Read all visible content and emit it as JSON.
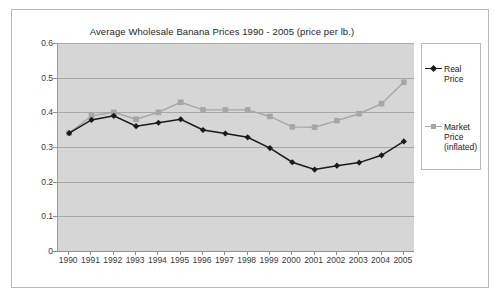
{
  "chart_data": {
    "type": "line",
    "title": "Average Wholesale Banana Prices 1990 - 2005  (price per lb.)",
    "xlabel": "",
    "ylabel": "",
    "categories": [
      "1990",
      "1991",
      "1992",
      "1993",
      "1994",
      "1995",
      "1996",
      "1997",
      "1998",
      "1999",
      "2000",
      "2001",
      "2002",
      "2003",
      "2004",
      "2005"
    ],
    "ylim": [
      0,
      0.6
    ],
    "ytick_labels": [
      "0.6",
      "0.5",
      "0.4",
      "0.3",
      "0.2",
      "0.1",
      "0"
    ],
    "ytick_values": [
      0.6,
      0.5,
      0.4,
      0.3,
      0.2,
      0.1,
      0
    ],
    "grid": true,
    "legend_position": "right",
    "plot_background": "#d6d6d6",
    "series": [
      {
        "name": "Real Price",
        "legend_label_lines": [
          "Real",
          "Price"
        ],
        "color": "#1a1a1a",
        "marker": "diamond",
        "values": [
          0.34,
          0.378,
          0.39,
          0.36,
          0.37,
          0.38,
          0.349,
          0.339,
          0.328,
          0.297,
          0.256,
          0.235,
          0.246,
          0.255,
          0.276,
          0.316
        ]
      },
      {
        "name": "Market Price (inflated)",
        "legend_label_lines": [
          "Market",
          "Price",
          "(inflated)"
        ],
        "color": "#a6a6a6",
        "marker": "square",
        "values": [
          0.34,
          0.39,
          0.4,
          0.38,
          0.4,
          0.429,
          0.407,
          0.407,
          0.407,
          0.388,
          0.358,
          0.357,
          0.376,
          0.396,
          0.425,
          0.487
        ]
      }
    ]
  }
}
